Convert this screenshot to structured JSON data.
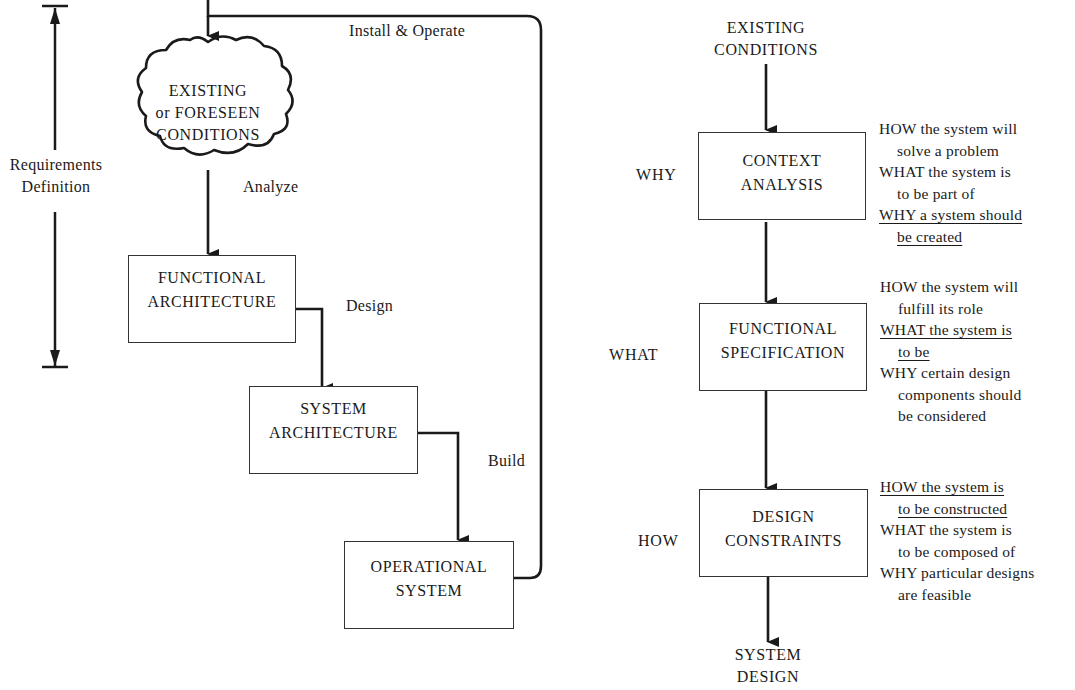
{
  "left_diagram": {
    "bracket_label": [
      "Requirements",
      "Definition"
    ],
    "cloud": [
      "EXISTING",
      "or FORESEEN",
      "CONDITIONS"
    ],
    "edges": {
      "feedback": "Install & Operate",
      "analyze": "Analyze",
      "design": "Design",
      "build": "Build"
    },
    "boxes": [
      {
        "lines": [
          "FUNCTIONAL",
          "ARCHITECTURE"
        ]
      },
      {
        "lines": [
          "SYSTEM",
          "ARCHITECTURE"
        ]
      },
      {
        "lines": [
          "OPERATIONAL",
          "SYSTEM"
        ]
      }
    ]
  },
  "right_diagram": {
    "start": [
      "EXISTING",
      "CONDITIONS"
    ],
    "end": [
      "SYSTEM",
      "DESIGN"
    ],
    "stages": [
      {
        "side_label": "WHY",
        "box": [
          "CONTEXT",
          "ANALYSIS"
        ],
        "notes": [
          {
            "text": "HOW the system will",
            "indent": false,
            "underline": false
          },
          {
            "text": "solve a problem",
            "indent": true,
            "underline": false
          },
          {
            "text": "WHAT the system is",
            "indent": false,
            "underline": false
          },
          {
            "text": "to be part of",
            "indent": true,
            "underline": false
          },
          {
            "text": "WHY a system should",
            "indent": false,
            "underline": true
          },
          {
            "text": "be created",
            "indent": true,
            "underline": true
          }
        ]
      },
      {
        "side_label": "WHAT",
        "box": [
          "FUNCTIONAL",
          "SPECIFICATION"
        ],
        "notes": [
          {
            "text": "HOW the system will",
            "indent": false,
            "underline": false
          },
          {
            "text": "fulfill its role",
            "indent": true,
            "underline": false
          },
          {
            "text": "WHAT the system is",
            "indent": false,
            "underline": true
          },
          {
            "text": "to be",
            "indent": true,
            "underline": true
          },
          {
            "text": "WHY certain design",
            "indent": false,
            "underline": false
          },
          {
            "text": "components should",
            "indent": true,
            "underline": false
          },
          {
            "text": "be considered",
            "indent": true,
            "underline": false
          }
        ]
      },
      {
        "side_label": "HOW",
        "box": [
          "DESIGN",
          "CONSTRAINTS"
        ],
        "notes": [
          {
            "text": "HOW the system is",
            "indent": false,
            "underline": true
          },
          {
            "text": "to be constructed",
            "indent": true,
            "underline": true
          },
          {
            "text": "WHAT the system is",
            "indent": false,
            "underline": false
          },
          {
            "text": "to be composed of",
            "indent": true,
            "underline": false
          },
          {
            "text": "WHY particular designs",
            "indent": false,
            "underline": false
          },
          {
            "text": "are feasible",
            "indent": true,
            "underline": false
          }
        ]
      }
    ]
  },
  "colors": {
    "ink": "#1a1a1a",
    "background": "#ffffff"
  }
}
